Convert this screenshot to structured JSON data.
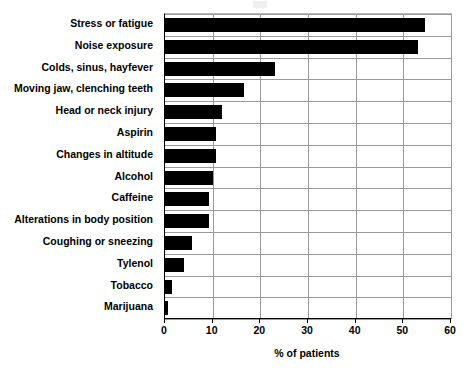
{
  "chart_data": {
    "type": "bar",
    "orientation": "horizontal",
    "title": "",
    "xlabel": "% of patients",
    "ylabel": "",
    "xlim": [
      0,
      60
    ],
    "xticks": [
      0,
      10,
      20,
      30,
      40,
      50,
      60
    ],
    "grid": true,
    "legend": null,
    "bar_color": "#000000",
    "categories": [
      "Stress or fatigue",
      "Noise exposure",
      "Colds, sinus, hayfever",
      "Moving jaw, clenching teeth",
      "Head or neck injury",
      "Aspirin",
      "Changes in altitude",
      "Alcohol",
      "Caffeine",
      "Alterations in body position",
      "Coughing or sneezing",
      "Tylenol",
      "Tobacco",
      "Marijuana"
    ],
    "values": [
      54.5,
      53,
      23,
      16.5,
      12,
      10.8,
      10.8,
      10,
      9.2,
      9.3,
      5.7,
      3.9,
      1.5,
      0.7
    ]
  },
  "axis": {
    "x_title": "% of patients",
    "tick_labels": [
      "0",
      "10",
      "20",
      "30",
      "40",
      "50",
      "60"
    ]
  }
}
